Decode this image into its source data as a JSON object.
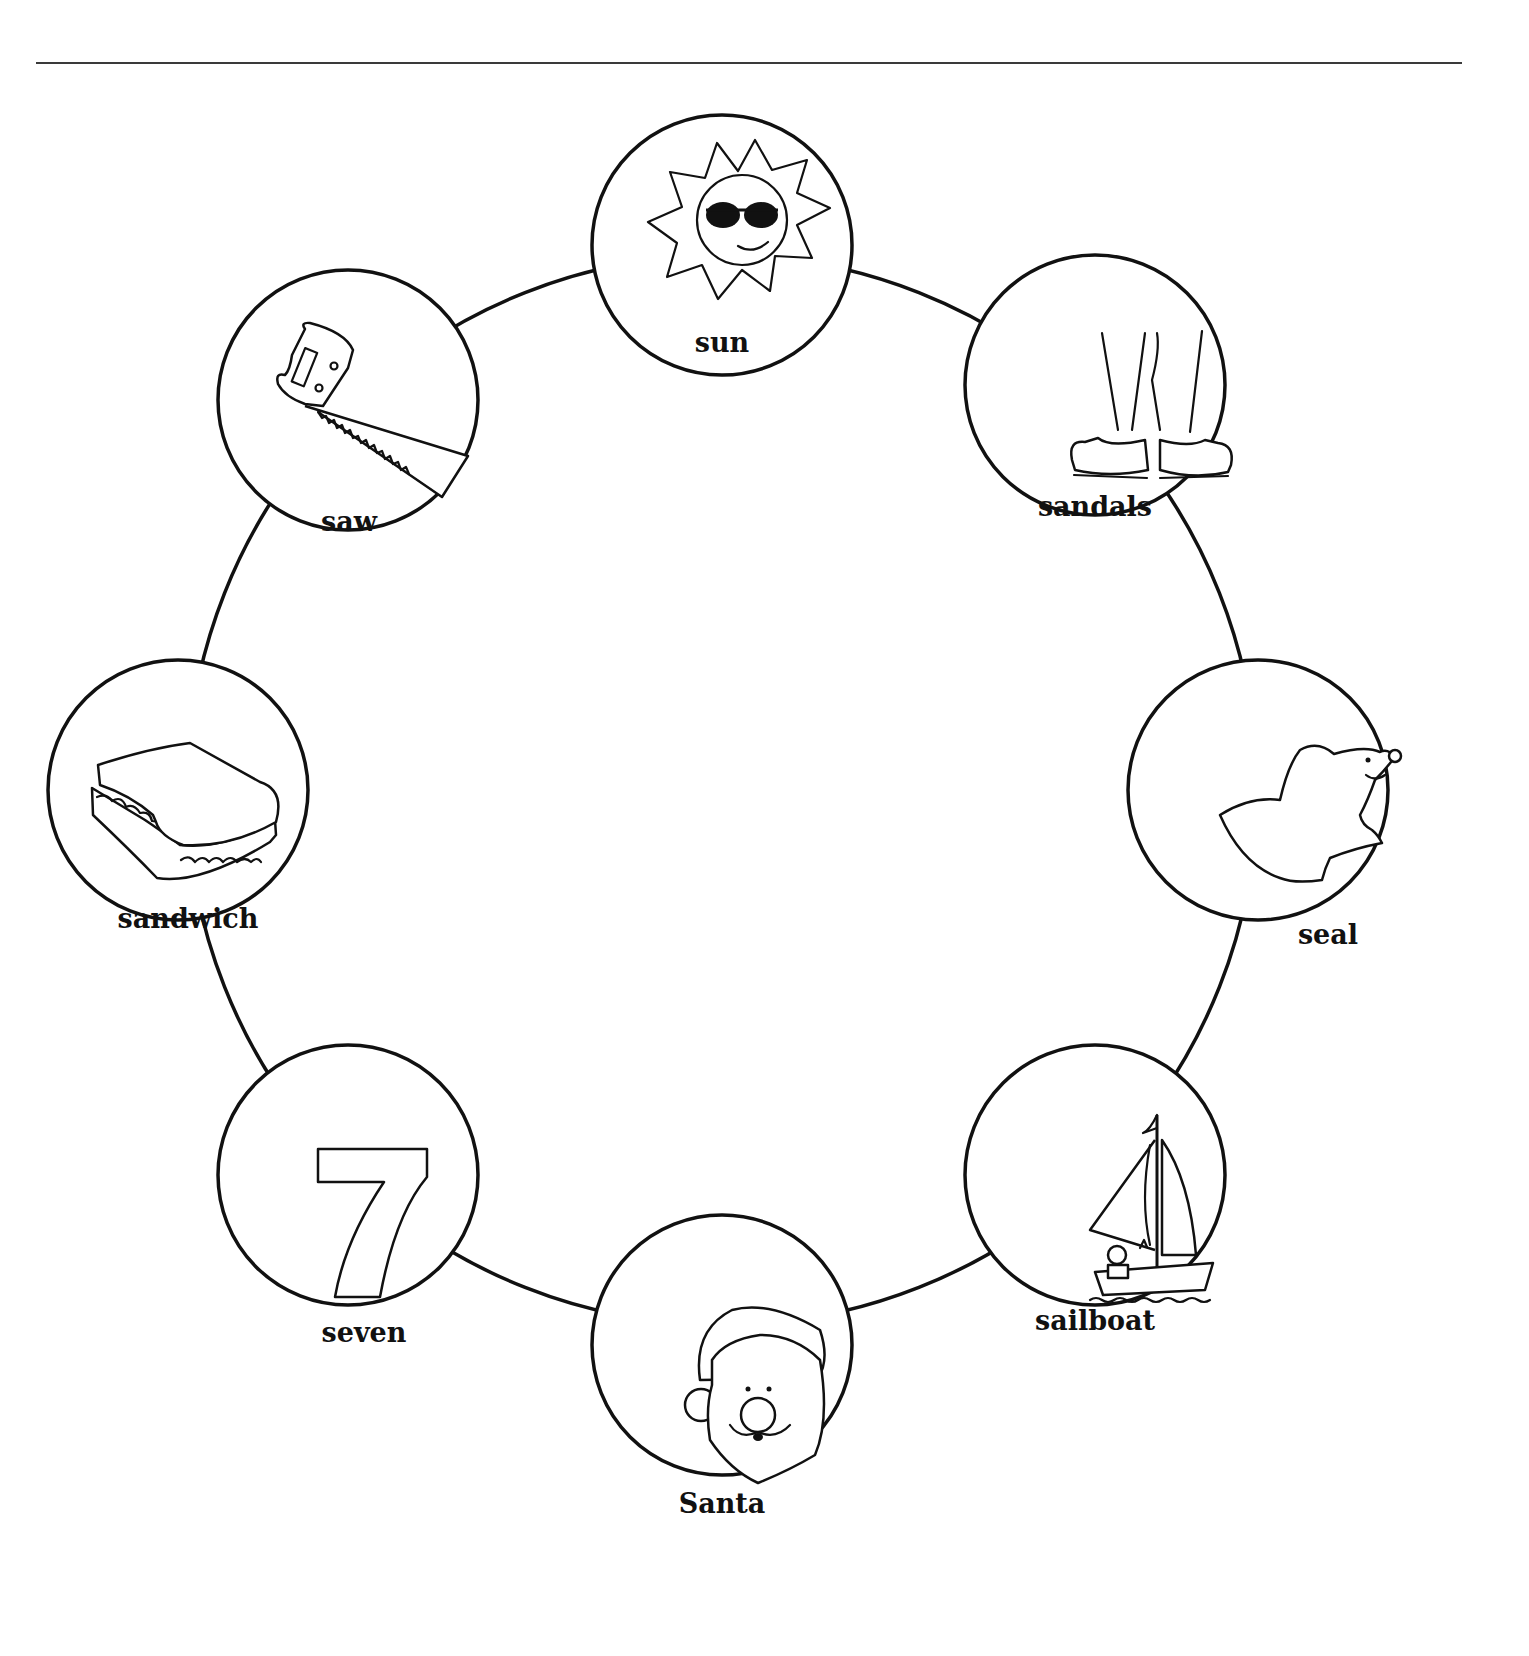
{
  "worksheet": {
    "ring": {
      "center_x": 722,
      "center_y": 790,
      "radius": 535
    },
    "items": [
      {
        "id": "sun",
        "label": "sun",
        "icon": "sun-with-sunglasses-icon",
        "cx": 722,
        "cy": 245
      },
      {
        "id": "sandals",
        "label": "sandals",
        "icon": "sandals-icon",
        "cx": 1095,
        "cy": 385
      },
      {
        "id": "seal",
        "label": "seal",
        "icon": "seal-icon",
        "cx": 1258,
        "cy": 790
      },
      {
        "id": "sailboat",
        "label": "sailboat",
        "icon": "sailboat-icon",
        "cx": 1095,
        "cy": 1175
      },
      {
        "id": "santa",
        "label": "Santa",
        "icon": "santa-face-icon",
        "cx": 722,
        "cy": 1345
      },
      {
        "id": "seven",
        "label": "seven",
        "icon": "number-seven-icon",
        "cx": 348,
        "cy": 1175
      },
      {
        "id": "sandwich",
        "label": "sandwich",
        "icon": "sandwich-icon",
        "cx": 178,
        "cy": 790
      },
      {
        "id": "saw",
        "label": "saw",
        "icon": "hand-saw-icon",
        "cx": 348,
        "cy": 400
      }
    ],
    "item_radius": 130,
    "seven_digit": "7",
    "colors": {
      "ink": "#111111",
      "paper": "#ffffff",
      "rule": "#3a3a3a"
    }
  }
}
